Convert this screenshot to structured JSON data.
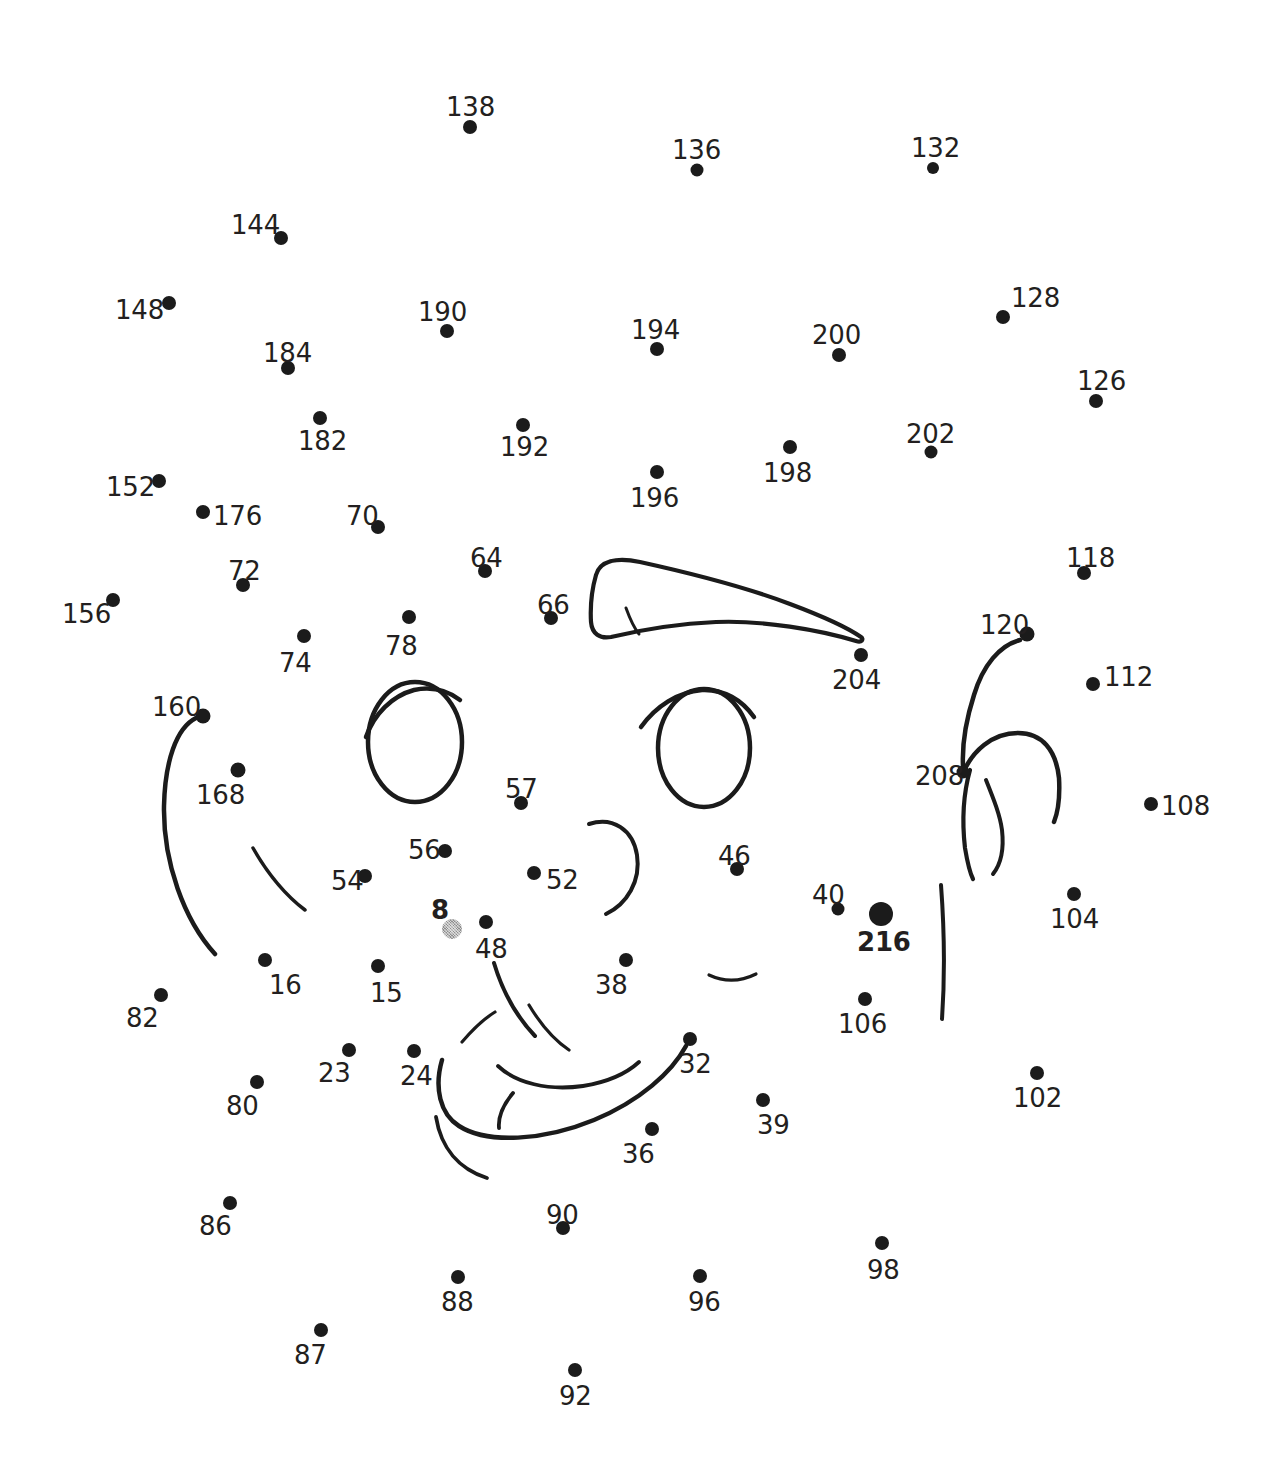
{
  "page": {
    "width": 1277,
    "height": 1462,
    "background_color": "#ffffff",
    "ink_color": "#1b1b1b",
    "label_color": "#231f20",
    "gray_dot_color": "#8e8e8e",
    "total_dots": 62,
    "start_dot_label": "216",
    "special_gray_dot_label": "8"
  },
  "dots": [
    {
      "label": "138",
      "dot_x": 470,
      "dot_y": 127,
      "label_x": 446,
      "label_y": 94,
      "r": 7,
      "style": "normal",
      "bold": false
    },
    {
      "label": "136",
      "dot_x": 697,
      "dot_y": 170,
      "label_x": 672,
      "label_y": 137,
      "r": 6.5,
      "style": "normal",
      "bold": false
    },
    {
      "label": "132",
      "dot_x": 933,
      "dot_y": 168,
      "label_x": 911,
      "label_y": 135,
      "r": 6,
      "style": "normal",
      "bold": false
    },
    {
      "label": "144",
      "dot_x": 281,
      "dot_y": 238,
      "label_x": 231,
      "label_y": 212,
      "r": 7,
      "style": "normal",
      "bold": false
    },
    {
      "label": "148",
      "dot_x": 169,
      "dot_y": 303,
      "label_x": 115,
      "label_y": 297,
      "r": 7,
      "style": "normal",
      "bold": false
    },
    {
      "label": "128",
      "dot_x": 1003,
      "dot_y": 317,
      "label_x": 1011,
      "label_y": 285,
      "r": 7,
      "style": "normal",
      "bold": false
    },
    {
      "label": "190",
      "dot_x": 447,
      "dot_y": 331,
      "label_x": 418,
      "label_y": 299,
      "r": 7,
      "style": "normal",
      "bold": false
    },
    {
      "label": "194",
      "dot_x": 657,
      "dot_y": 349,
      "label_x": 631,
      "label_y": 317,
      "r": 7,
      "style": "normal",
      "bold": false
    },
    {
      "label": "200",
      "dot_x": 839,
      "dot_y": 355,
      "label_x": 812,
      "label_y": 322,
      "r": 7,
      "style": "normal",
      "bold": false
    },
    {
      "label": "184",
      "dot_x": 288,
      "dot_y": 368,
      "label_x": 263,
      "label_y": 340,
      "r": 7,
      "style": "normal",
      "bold": false
    },
    {
      "label": "126",
      "dot_x": 1096,
      "dot_y": 401,
      "label_x": 1077,
      "label_y": 368,
      "r": 7,
      "style": "normal",
      "bold": false
    },
    {
      "label": "182",
      "dot_x": 320,
      "dot_y": 418,
      "label_x": 298,
      "label_y": 428,
      "r": 7,
      "style": "normal",
      "bold": false
    },
    {
      "label": "192",
      "dot_x": 523,
      "dot_y": 425,
      "label_x": 500,
      "label_y": 434,
      "r": 7,
      "style": "normal",
      "bold": false
    },
    {
      "label": "202",
      "dot_x": 931,
      "dot_y": 452,
      "label_x": 906,
      "label_y": 421,
      "r": 6.5,
      "style": "normal",
      "bold": false
    },
    {
      "label": "198",
      "dot_x": 790,
      "dot_y": 447,
      "label_x": 763,
      "label_y": 460,
      "r": 7,
      "style": "normal",
      "bold": false
    },
    {
      "label": "196",
      "dot_x": 657,
      "dot_y": 472,
      "label_x": 630,
      "label_y": 485,
      "r": 7,
      "style": "normal",
      "bold": false
    },
    {
      "label": "152",
      "dot_x": 159,
      "dot_y": 481,
      "label_x": 106,
      "label_y": 474,
      "r": 7,
      "style": "normal",
      "bold": false
    },
    {
      "label": "176",
      "dot_x": 203,
      "dot_y": 512,
      "label_x": 213,
      "label_y": 503,
      "r": 7,
      "style": "normal",
      "bold": false
    },
    {
      "label": "70",
      "dot_x": 378,
      "dot_y": 527,
      "label_x": 346,
      "label_y": 503,
      "r": 7,
      "style": "normal",
      "bold": false
    },
    {
      "label": "64",
      "dot_x": 485,
      "dot_y": 571,
      "label_x": 470,
      "label_y": 545,
      "r": 7,
      "style": "normal",
      "bold": false
    },
    {
      "label": "72",
      "dot_x": 243,
      "dot_y": 585,
      "label_x": 228,
      "label_y": 558,
      "r": 7,
      "style": "normal",
      "bold": false
    },
    {
      "label": "118",
      "dot_x": 1084,
      "dot_y": 573,
      "label_x": 1066,
      "label_y": 545,
      "r": 7,
      "style": "normal",
      "bold": false
    },
    {
      "label": "156",
      "dot_x": 113,
      "dot_y": 600,
      "label_x": 62,
      "label_y": 601,
      "r": 7,
      "style": "normal",
      "bold": false
    },
    {
      "label": "66",
      "dot_x": 551,
      "dot_y": 618,
      "label_x": 537,
      "label_y": 592,
      "r": 7,
      "style": "normal",
      "bold": false
    },
    {
      "label": "78",
      "dot_x": 409,
      "dot_y": 617,
      "label_x": 385,
      "label_y": 633,
      "r": 7,
      "style": "normal",
      "bold": false
    },
    {
      "label": "120",
      "dot_x": 1027,
      "dot_y": 634,
      "label_x": 980,
      "label_y": 612,
      "r": 7.5,
      "style": "normal",
      "bold": false
    },
    {
      "label": "74",
      "dot_x": 304,
      "dot_y": 636,
      "label_x": 279,
      "label_y": 650,
      "r": 7,
      "style": "normal",
      "bold": false
    },
    {
      "label": "204",
      "dot_x": 861,
      "dot_y": 655,
      "label_x": 832,
      "label_y": 667,
      "r": 7,
      "style": "normal",
      "bold": false
    },
    {
      "label": "112",
      "dot_x": 1093,
      "dot_y": 684,
      "label_x": 1104,
      "label_y": 664,
      "r": 7,
      "style": "normal",
      "bold": false
    },
    {
      "label": "160",
      "dot_x": 203,
      "dot_y": 716,
      "label_x": 152,
      "label_y": 694,
      "r": 7.5,
      "style": "normal",
      "bold": false
    },
    {
      "label": "208",
      "dot_x": 963,
      "dot_y": 772,
      "label_x": 915,
      "label_y": 763,
      "r": 6.5,
      "style": "normal",
      "bold": false
    },
    {
      "label": "168",
      "dot_x": 238,
      "dot_y": 770,
      "label_x": 196,
      "label_y": 782,
      "r": 7.5,
      "style": "normal",
      "bold": false
    },
    {
      "label": "57",
      "dot_x": 521,
      "dot_y": 803,
      "label_x": 505,
      "label_y": 776,
      "r": 7,
      "style": "normal",
      "bold": false
    },
    {
      "label": "108",
      "dot_x": 1151,
      "dot_y": 804,
      "label_x": 1161,
      "label_y": 793,
      "r": 7,
      "style": "normal",
      "bold": false
    },
    {
      "label": "56",
      "dot_x": 445,
      "dot_y": 851,
      "label_x": 408,
      "label_y": 837,
      "r": 7,
      "style": "normal",
      "bold": false
    },
    {
      "label": "46",
      "dot_x": 737,
      "dot_y": 869,
      "label_x": 718,
      "label_y": 843,
      "r": 7,
      "style": "normal",
      "bold": false
    },
    {
      "label": "52",
      "dot_x": 534,
      "dot_y": 873,
      "label_x": 546,
      "label_y": 867,
      "r": 7,
      "style": "normal",
      "bold": false
    },
    {
      "label": "54",
      "dot_x": 365,
      "dot_y": 876,
      "label_x": 331,
      "label_y": 868,
      "r": 7,
      "style": "normal",
      "bold": false
    },
    {
      "label": "40",
      "dot_x": 838,
      "dot_y": 909,
      "label_x": 812,
      "label_y": 882,
      "r": 6.5,
      "style": "normal",
      "bold": false
    },
    {
      "label": "216",
      "dot_x": 881,
      "dot_y": 914,
      "label_x": 857,
      "label_y": 929,
      "r": 12,
      "style": "normal",
      "bold": true
    },
    {
      "label": "8",
      "dot_x": 452,
      "dot_y": 929,
      "label_x": 431,
      "label_y": 897,
      "r": 10,
      "style": "gray",
      "bold": true
    },
    {
      "label": "104",
      "dot_x": 1074,
      "dot_y": 894,
      "label_x": 1050,
      "label_y": 906,
      "r": 7,
      "style": "normal",
      "bold": false
    },
    {
      "label": "48",
      "dot_x": 486,
      "dot_y": 922,
      "label_x": 475,
      "label_y": 936,
      "r": 7,
      "style": "normal",
      "bold": false
    },
    {
      "label": "16",
      "dot_x": 265,
      "dot_y": 960,
      "label_x": 269,
      "label_y": 972,
      "r": 7,
      "style": "normal",
      "bold": false
    },
    {
      "label": "15",
      "dot_x": 378,
      "dot_y": 966,
      "label_x": 370,
      "label_y": 980,
      "r": 7,
      "style": "normal",
      "bold": false
    },
    {
      "label": "38",
      "dot_x": 626,
      "dot_y": 960,
      "label_x": 595,
      "label_y": 972,
      "r": 7,
      "style": "normal",
      "bold": false
    },
    {
      "label": "106",
      "dot_x": 865,
      "dot_y": 999,
      "label_x": 838,
      "label_y": 1011,
      "r": 7,
      "style": "normal",
      "bold": false
    },
    {
      "label": "82",
      "dot_x": 161,
      "dot_y": 995,
      "label_x": 126,
      "label_y": 1005,
      "r": 7,
      "style": "normal",
      "bold": false
    },
    {
      "label": "23",
      "dot_x": 349,
      "dot_y": 1050,
      "label_x": 318,
      "label_y": 1060,
      "r": 7,
      "style": "normal",
      "bold": false
    },
    {
      "label": "32",
      "dot_x": 690,
      "dot_y": 1039,
      "label_x": 679,
      "label_y": 1051,
      "r": 7,
      "style": "normal",
      "bold": false
    },
    {
      "label": "24",
      "dot_x": 414,
      "dot_y": 1051,
      "label_x": 400,
      "label_y": 1063,
      "r": 7,
      "style": "normal",
      "bold": false
    },
    {
      "label": "102",
      "dot_x": 1037,
      "dot_y": 1073,
      "label_x": 1013,
      "label_y": 1085,
      "r": 7,
      "style": "normal",
      "bold": false
    },
    {
      "label": "80",
      "dot_x": 257,
      "dot_y": 1082,
      "label_x": 226,
      "label_y": 1093,
      "r": 7,
      "style": "normal",
      "bold": false
    },
    {
      "label": "39",
      "dot_x": 763,
      "dot_y": 1100,
      "label_x": 757,
      "label_y": 1112,
      "r": 7,
      "style": "normal",
      "bold": false
    },
    {
      "label": "36",
      "dot_x": 652,
      "dot_y": 1129,
      "label_x": 622,
      "label_y": 1141,
      "r": 7,
      "style": "normal",
      "bold": false
    },
    {
      "label": "86",
      "dot_x": 230,
      "dot_y": 1203,
      "label_x": 199,
      "label_y": 1213,
      "r": 7,
      "style": "normal",
      "bold": false
    },
    {
      "label": "90",
      "dot_x": 563,
      "dot_y": 1228,
      "label_x": 546,
      "label_y": 1202,
      "r": 7,
      "style": "normal",
      "bold": false
    },
    {
      "label": "98",
      "dot_x": 882,
      "dot_y": 1243,
      "label_x": 867,
      "label_y": 1257,
      "r": 7,
      "style": "normal",
      "bold": false
    },
    {
      "label": "88",
      "dot_x": 458,
      "dot_y": 1277,
      "label_x": 441,
      "label_y": 1289,
      "r": 7,
      "style": "normal",
      "bold": false
    },
    {
      "label": "96",
      "dot_x": 700,
      "dot_y": 1276,
      "label_x": 688,
      "label_y": 1289,
      "r": 7,
      "style": "normal",
      "bold": false
    },
    {
      "label": "87",
      "dot_x": 321,
      "dot_y": 1330,
      "label_x": 294,
      "label_y": 1342,
      "r": 7,
      "style": "normal",
      "bold": false
    },
    {
      "label": "92",
      "dot_x": 575,
      "dot_y": 1370,
      "label_x": 559,
      "label_y": 1383,
      "r": 7,
      "style": "normal",
      "bold": false
    }
  ],
  "artwork": {
    "description": "Partially completed line drawing of a face: eyebrow, two eyes with lashes, nose, mouth, ear and cheek strokes",
    "strokes": [
      "left-eyebrow-shape",
      "left-eye-oval",
      "left-eye-lash",
      "right-eye-oval",
      "right-eye-lash",
      "nose-right-curve",
      "nostril-curves",
      "mouth-upper-lip",
      "mouth-lower-lip",
      "chin-curve",
      "left-cheek-long-curve",
      "left-cheek-short-curve",
      "right-cheek-curve",
      "ear-outer-curve",
      "ear-inner-curve",
      "ear-hook-curve",
      "neck-line"
    ]
  }
}
